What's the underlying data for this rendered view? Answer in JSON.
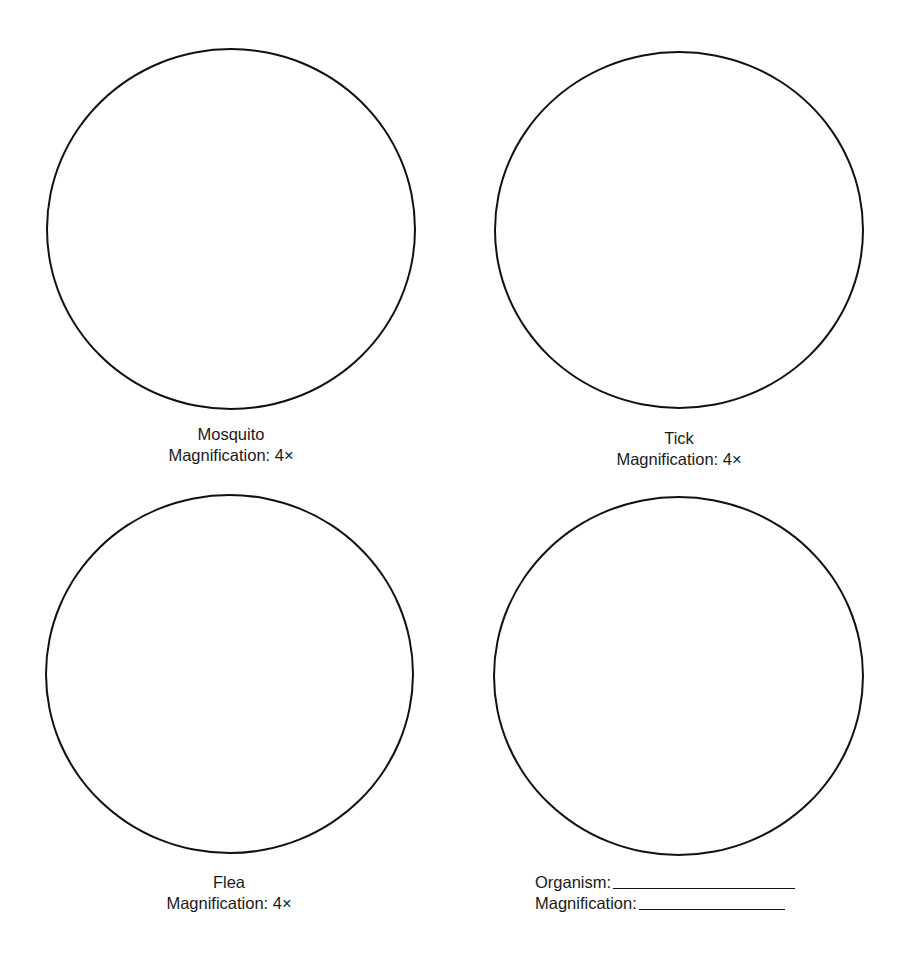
{
  "panels": [
    {
      "organism": "Mosquito",
      "magnification_label": "Magnification: 4×"
    },
    {
      "organism": "Tick",
      "magnification_label": "Magnification: 4×"
    },
    {
      "organism": "Flea",
      "magnification_label": "Magnification: 4×"
    }
  ],
  "blank_panel": {
    "organism_label": "Organism:",
    "organism_value": "",
    "magnification_label": "Magnification:",
    "magnification_value": ""
  }
}
